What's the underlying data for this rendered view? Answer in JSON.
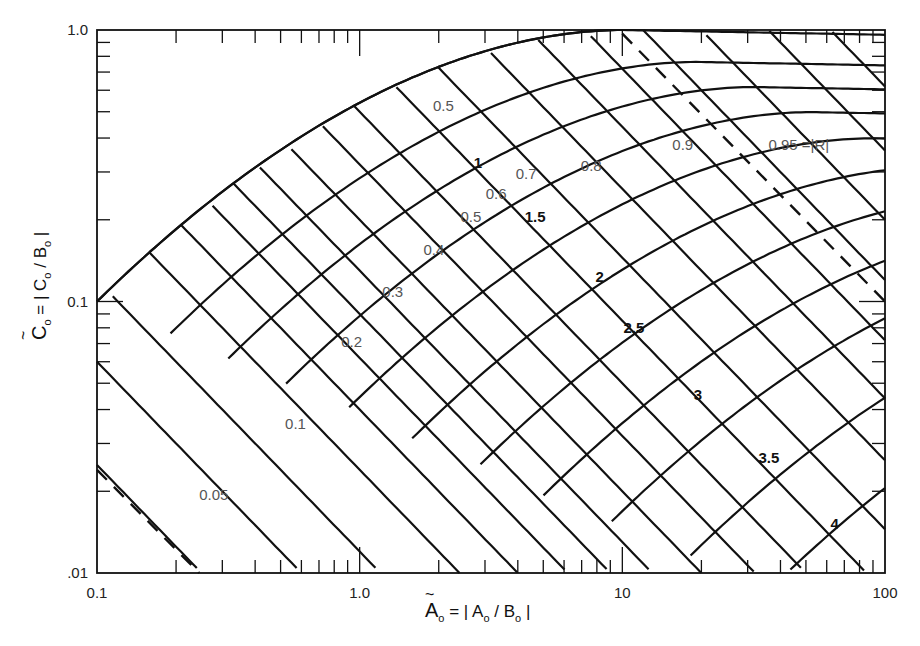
{
  "chart_data": {
    "type": "line",
    "title": "",
    "xlabel": "Ã₀ = |A₀ / B₀|",
    "ylabel": "C̃₀ = |C₀ / B₀|",
    "x_scale": "log",
    "y_scale": "log",
    "xlim": [
      0.1,
      100
    ],
    "ylim": [
      0.01,
      1.0
    ],
    "x_tick_labels": [
      "0.1",
      "1.0",
      "10",
      "100"
    ],
    "y_tick_labels": [
      "1.0",
      "0.1",
      ".01"
    ],
    "grid": false,
    "legend": null,
    "families": [
      {
        "name": "|R| (reflection magnitude, diagonal lines)",
        "values": [
          "0.05",
          "0.1",
          "0.2",
          "0.3",
          "0.4",
          "0.5",
          "0.6",
          "0.7",
          "0.8",
          "0.9",
          "0.95"
        ],
        "dashed_boundaries": [
          "0.05",
          "0.95"
        ]
      },
      {
        "name": "phase parameter (curved lines)",
        "values": [
          "0.5",
          "1",
          "1.5",
          "2",
          "2.5",
          "3",
          "3.5",
          "4"
        ]
      }
    ],
    "annotations": [
      "0.95 = |R|"
    ]
  },
  "axes": {
    "x_ticks": [
      {
        "label": "0.1",
        "value": 0.1
      },
      {
        "label": "1.0",
        "value": 1
      },
      {
        "label": "10",
        "value": 10
      },
      {
        "label": "100",
        "value": 100
      }
    ],
    "y_ticks": [
      {
        "label": "1.0",
        "value": 1
      },
      {
        "label": "0.1",
        "value": 0.1
      },
      {
        "label": ".01",
        "value": 0.01
      }
    ],
    "x_title_main": "A",
    "x_title_rest": " = | A",
    "x_title_mid": " / B",
    "x_title_end": " |",
    "y_title_main": "C",
    "y_title_rest": " = | C",
    "y_title_mid": " / B",
    "y_title_end": " |"
  },
  "labels": {
    "r": [
      {
        "text": "0.05",
        "x": 0.245,
        "y": 0.0185,
        "style": "light"
      },
      {
        "text": "0.1",
        "x": 0.52,
        "y": 0.034,
        "style": "light"
      },
      {
        "text": "0.2",
        "x": 0.85,
        "y": 0.068,
        "style": "light"
      },
      {
        "text": "0.3",
        "x": 1.22,
        "y": 0.104,
        "style": "light"
      },
      {
        "text": "0.4",
        "x": 1.75,
        "y": 0.148,
        "style": "light"
      },
      {
        "text": "0.5",
        "x": 2.42,
        "y": 0.196,
        "style": "light"
      },
      {
        "text": "0.6",
        "x": 3.02,
        "y": 0.238,
        "style": "light"
      },
      {
        "text": "0.7",
        "x": 3.93,
        "y": 0.282,
        "style": "light"
      },
      {
        "text": "0.8",
        "x": 6.95,
        "y": 0.302,
        "style": "light"
      },
      {
        "text": "0.9",
        "x": 15.5,
        "y": 0.36,
        "style": "light"
      },
      {
        "text": "0.95 =|R|",
        "x": 36,
        "y": 0.36,
        "style": "light"
      },
      {
        "text": "0.5",
        "x": 1.9,
        "y": 0.505,
        "style": "light"
      }
    ],
    "phase": [
      {
        "text": "1",
        "x": 2.72,
        "y": 0.31,
        "style": "bold"
      },
      {
        "text": "1.5",
        "x": 4.25,
        "y": 0.197,
        "style": "bold"
      },
      {
        "text": "2",
        "x": 7.9,
        "y": 0.118,
        "style": "bold"
      },
      {
        "text": "2.5",
        "x": 10.1,
        "y": 0.0765,
        "style": "bold"
      },
      {
        "text": "3",
        "x": 18.7,
        "y": 0.0435,
        "style": "bold"
      },
      {
        "text": "3.5",
        "x": 33,
        "y": 0.0255,
        "style": "bold"
      },
      {
        "text": "4",
        "x": 62,
        "y": 0.0145,
        "style": "bold"
      }
    ]
  }
}
